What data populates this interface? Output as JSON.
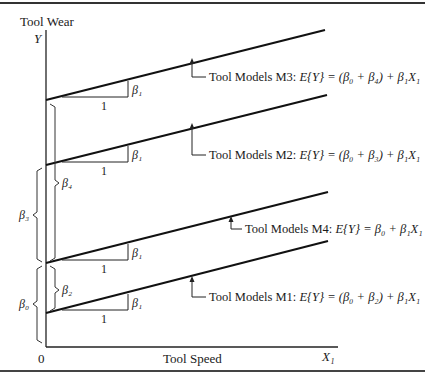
{
  "figure": {
    "y_axis_title": "Tool Wear",
    "y_axis_symbol": "Y",
    "x_axis_title": "Tool Speed",
    "x_axis_symbol": "X₁",
    "origin_label": "0",
    "slope_run_label": "1",
    "slope_rise_label": "β₁"
  },
  "lines": [
    {
      "id": "M3",
      "label": "Tool Models M3:",
      "equation": "E{Y} = (β₀ + β₄) + β₁X₁"
    },
    {
      "id": "M2",
      "label": "Tool Models M2:",
      "equation": "E{Y} = (β₀ + β₃) + β₁X₁"
    },
    {
      "id": "M4",
      "label": "Tool Models M4:",
      "equation": "E{Y} = β₀ + β₁X₁"
    },
    {
      "id": "M1",
      "label": "Tool Models M1:",
      "equation": "E{Y} = (β₀ + β₂) + β₁X₁"
    }
  ],
  "braces": {
    "beta4": "β₄",
    "beta3": "β₃",
    "beta2": "β₂",
    "beta0": "β₀"
  }
}
